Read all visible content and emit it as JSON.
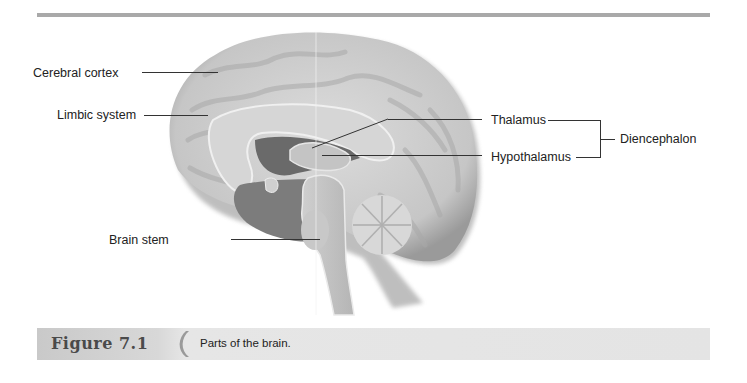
{
  "figure": {
    "number_label": "Figure 7.1",
    "caption": "Parts of the brain.",
    "image_description": "Midsagittal section of the human brain",
    "labels": {
      "cerebral_cortex": "Cerebral cortex",
      "limbic_system": "Limbic system",
      "thalamus": "Thalamus",
      "hypothalamus": "Hypothalamus",
      "diencephalon": "Diencephalon",
      "brain_stem": "Brain stem"
    }
  },
  "colors": {
    "rule": "#a9a9a9",
    "caption_bar": "#e4e4e4",
    "figure_number": "#4a4a4a",
    "brain_light": "#d4d4d4",
    "brain_mid": "#bdbdbd",
    "brain_dark": "#6f6f6f"
  }
}
